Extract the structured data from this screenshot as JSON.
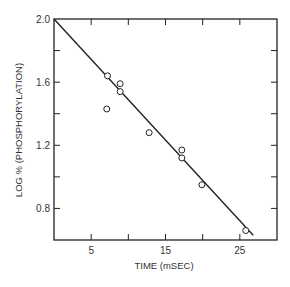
{
  "chart_data": {
    "type": "scatter",
    "title": "",
    "xlabel": "TIME (mSEC)",
    "ylabel": "LOG % (PHOSPHORYLATION)",
    "xlim": [
      0,
      30
    ],
    "ylim": [
      0.6,
      2.0
    ],
    "x_ticks": [
      5,
      10,
      15,
      20,
      25
    ],
    "x_tick_labels": [
      "5",
      "",
      "15",
      "",
      "25"
    ],
    "y_ticks": [
      0.6,
      0.8,
      1.0,
      1.2,
      1.4,
      1.6,
      1.8,
      2.0
    ],
    "y_tick_labels": [
      "",
      "0.8",
      "",
      "1.2",
      "",
      "1.6",
      "",
      "2.0"
    ],
    "grid": false,
    "legend": null,
    "marker": "open-circle",
    "series": [
      {
        "name": "data",
        "points": [
          {
            "x": 7.2,
            "y": 1.64
          },
          {
            "x": 7.1,
            "y": 1.43
          },
          {
            "x": 8.9,
            "y": 1.59
          },
          {
            "x": 8.9,
            "y": 1.54
          },
          {
            "x": 12.8,
            "y": 1.28
          },
          {
            "x": 17.2,
            "y": 1.17
          },
          {
            "x": 17.2,
            "y": 1.12
          },
          {
            "x": 19.9,
            "y": 0.95
          },
          {
            "x": 25.8,
            "y": 0.66
          }
        ]
      }
    ],
    "fit_line": {
      "x": [
        0,
        26.8
      ],
      "y": [
        2.0,
        0.63
      ]
    }
  },
  "colors": {
    "ink": "#222222",
    "background": "#ffffff"
  }
}
